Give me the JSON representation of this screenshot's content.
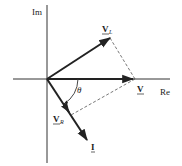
{
  "diagram": {
    "type": "phasor-diagram",
    "axes": {
      "imaginary_label": "Im",
      "real_label": "Re"
    },
    "phasors": {
      "V_L": {
        "label_main": "V",
        "label_sub": "L"
      },
      "V": {
        "label_main": "V",
        "label_sub": ""
      },
      "V_R": {
        "label_main": "V",
        "label_sub": "R"
      },
      "I": {
        "label_main": "I",
        "label_sub": ""
      }
    },
    "angle_label": "θ",
    "colors": {
      "ink": "#222222",
      "dashed": "#555555",
      "background": "#ffffff"
    }
  }
}
